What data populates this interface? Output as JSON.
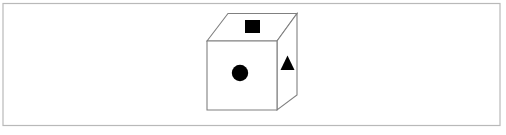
{
  "canvas": {
    "width": 506,
    "height": 135,
    "background_color": "#ffffff"
  },
  "frame": {
    "name": "outer-border",
    "x": 3,
    "y": 3.5,
    "width": 497,
    "height": 122,
    "stroke_color": "#b9b9b9",
    "stroke_width": 1.2,
    "fill": "none"
  },
  "figure": {
    "label": "cube",
    "stroke_color": "#808080",
    "stroke_width": 1.1,
    "face_fill": "#ffffff",
    "mark_color": "#000000",
    "faces": {
      "front": {
        "name": "cube-front-face",
        "points": "207,41 277,41 277,110 207,110"
      },
      "top": {
        "name": "cube-top-face",
        "points": "207,41 228,13.5 297,13.5 277,41"
      },
      "right": {
        "name": "cube-right-face",
        "points": "277,41 297,13.5 297,95 277,110"
      }
    },
    "marks": {
      "square": {
        "name": "square-mark",
        "shape": "square",
        "x": 245,
        "y": 20,
        "width": 15,
        "height": 13
      },
      "circle": {
        "name": "circle-mark",
        "shape": "circle",
        "cx": 240,
        "cy": 73,
        "r": 8.2
      },
      "triangle": {
        "name": "triangle-mark",
        "shape": "triangle",
        "points": "287.5,55.5 294.5,70 280.5,70"
      }
    }
  }
}
